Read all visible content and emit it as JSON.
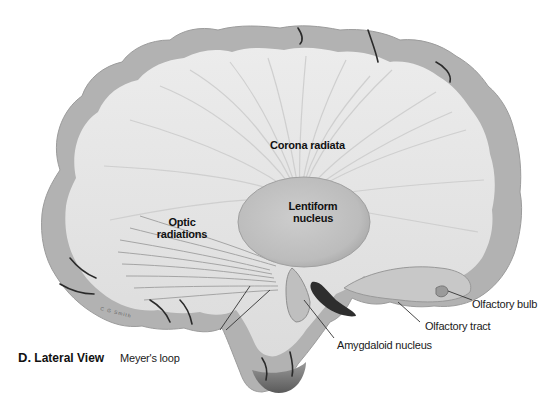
{
  "figure": {
    "caption_letter": "D.",
    "caption_text": "Lateral View",
    "artist_signature": "C G Smith",
    "view": "Lateral view of cerebral hemisphere dissection showing white matter fiber tracts"
  },
  "labels": {
    "corona_radiata": "Corona radiata",
    "lentiform_nucleus_line1": "Lentiform",
    "lentiform_nucleus_line2": "nucleus",
    "optic_radiations_line1": "Optic",
    "optic_radiations_line2": "radiations",
    "olfactory_bulb": "Olfactory bulb",
    "olfactory_tract": "Olfactory tract",
    "amygdaloid_nucleus": "Amygdaloid nucleus",
    "meyers_loop": "Meyer's loop"
  },
  "colors": {
    "background": "#ffffff",
    "gray_matter": "#b4b4b4",
    "white_matter": "#e6e6e6",
    "fibers": "#cfcfcf",
    "lentiform": "#c2c2c2",
    "sulcus": "#2a2a2a",
    "leader_line": "#333333"
  }
}
